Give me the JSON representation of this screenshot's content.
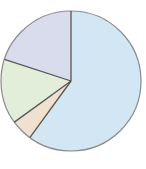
{
  "chart_data": {
    "type": "pie",
    "title": "",
    "start_angle_deg": 0,
    "direction": "clockwise",
    "slices": [
      {
        "label": "",
        "value": 60,
        "color": "#d3e6f3"
      },
      {
        "label": "",
        "value": 5,
        "color": "#efe0d0"
      },
      {
        "label": "",
        "value": 15,
        "color": "#e2eed9"
      },
      {
        "label": "",
        "value": 20,
        "color": "#d9dcec"
      }
    ],
    "legend": null,
    "stroke_color": "#555555",
    "outline_color": "#8a8a8a"
  }
}
